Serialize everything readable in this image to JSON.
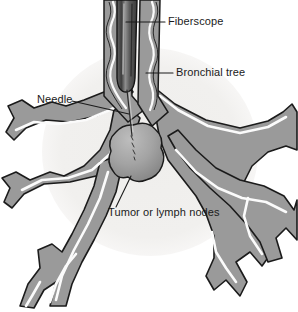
{
  "figure": {
    "background_color": "#ffffff",
    "halo_color": "#f0efed",
    "airway_fill": "#9a9a9a",
    "airway_outline": "#1b1b1b",
    "lumen_color": "#fbfbfb",
    "scope_dark": "#4a4a4a",
    "scope_mid": "#6f6f6f",
    "scope_highlight": "#9d9d9d",
    "tumor_light": "#b4b4b4",
    "tumor_dark": "#8a8a8a",
    "text_color": "#1b1b1b"
  },
  "labels": {
    "fiberscope": {
      "text": "Fiberscope",
      "x": 168,
      "y": 25
    },
    "bronchial_tree": {
      "text": "Bronchial tree",
      "x": 176,
      "y": 76
    },
    "needle": {
      "text": "Needle",
      "x": 37,
      "y": 103
    },
    "tumor": {
      "text": "Tumor or lymph nodes",
      "x": 108,
      "y": 216
    }
  },
  "structures": {
    "fiberscope_name": "flexible fiberoptic bronchoscope",
    "trachea_name": "trachea",
    "carina_name": "carina",
    "needle_name": "aspiration needle",
    "tumor_name": "tumor or lymph node mass",
    "left_bronchus_name": "left main bronchus",
    "right_bronchus_name": "right main bronchus"
  }
}
